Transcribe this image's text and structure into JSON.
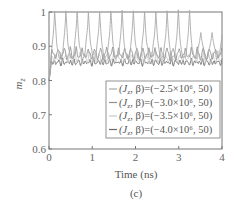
{
  "chart_data": {
    "type": "line",
    "title": "",
    "caption": "(c)",
    "xlabel": "Time (ns)",
    "ylabel": "m_z",
    "xlim": [
      0,
      4
    ],
    "ylim": [
      0.6,
      1.0
    ],
    "xticks": [
      "0",
      "1",
      "2",
      "3",
      "4"
    ],
    "yticks": [
      "0.6",
      "0.7",
      "0.8",
      "0.9",
      "1"
    ],
    "grid": false,
    "legend_position": "lower right",
    "series": [
      {
        "name": "(J_z, β)=(−2.5×10⁶, 50)",
        "color": "#a8a8a8",
        "baseline": 0.865,
        "peak": 1.0,
        "period_ns": 0.26,
        "description": "large periodic spikes between ~0.86 and ~1.0"
      },
      {
        "name": "(J_z, β)=(−3.0×10⁶, 50)",
        "color": "#909090",
        "baseline": 0.865,
        "peak": 0.895,
        "period_ns": 0.14,
        "description": "oscillation ~0.86–0.89"
      },
      {
        "name": "(J_z, β)=(−3.5×10⁶, 50)",
        "color": "#c8c8c8",
        "baseline": 0.855,
        "peak": 0.88,
        "period_ns": 0.11,
        "description": "oscillation ~0.85–0.88"
      },
      {
        "name": "(J_z, β)=(−4.0×10⁶, 50)",
        "color": "#6a6a6a",
        "baseline": 0.848,
        "peak": 0.86,
        "period_ns": 0.09,
        "description": "small oscillation ~0.845–0.86"
      }
    ],
    "initial_transient": {
      "x": 0.0,
      "min": 0.8
    }
  },
  "legend": {
    "items": [
      {
        "prefix": "(J",
        "sub": "z",
        "rest": ", β)=(−2.5×10⁶, 50)"
      },
      {
        "prefix": "(J",
        "sub": "z",
        "rest": ", β)=(−3.0×10⁶, 50)"
      },
      {
        "prefix": "(J",
        "sub": "z",
        "rest": ", β)=(−3.5×10⁶, 50)"
      },
      {
        "prefix": "(J",
        "sub": "z",
        "rest": ", β)=(−4.0×10⁶, 50)"
      }
    ]
  },
  "axes": {
    "xlabel": "Time (ns)",
    "ylabel_main": "m",
    "ylabel_sub": "z",
    "caption": "(c)"
  }
}
